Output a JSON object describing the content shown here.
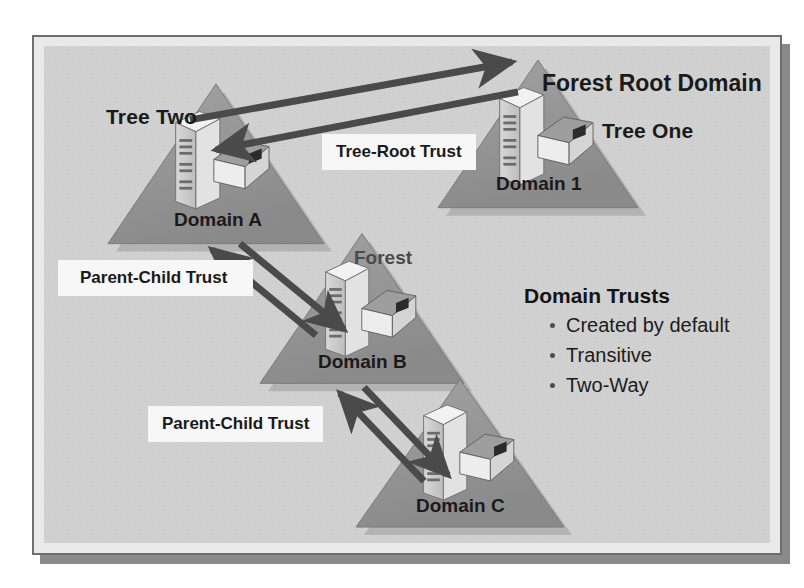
{
  "diagram": {
    "background_color": "#cbcbcb",
    "frame_color": "#e9e9e9",
    "triangle_fill": "#8f8f8f",
    "arrow_color": "#4a4a4a"
  },
  "labels": {
    "forest_root_domain": "Forest Root Domain",
    "tree_one": "Tree One",
    "tree_two": "Tree Two",
    "forest": "Forest"
  },
  "domains": [
    {
      "id": "domain-1",
      "label": "Domain 1",
      "tree": "Tree One"
    },
    {
      "id": "domain-a",
      "label": "Domain A",
      "tree": "Tree Two"
    },
    {
      "id": "domain-b",
      "label": "Domain B",
      "tree": "Tree Two"
    },
    {
      "id": "domain-c",
      "label": "Domain C",
      "tree": "Tree Two"
    }
  ],
  "trust_links": [
    {
      "id": "tree-root-trust",
      "label": "Tree-Root Trust",
      "from": "Domain A",
      "to": "Domain 1",
      "direction": "two-way"
    },
    {
      "id": "parent-child-trust-ab",
      "label": "Parent-Child Trust",
      "from": "Domain A",
      "to": "Domain B",
      "direction": "two-way"
    },
    {
      "id": "parent-child-trust-bc",
      "label": "Parent-Child Trust",
      "from": "Domain B",
      "to": "Domain C",
      "direction": "two-way"
    }
  ],
  "trusts_block": {
    "title": "Domain Trusts",
    "bullets": [
      "Created by default",
      "Transitive",
      "Two-Way"
    ]
  },
  "icons": {
    "server": "server-tower-icon",
    "directory": "open-book-icon",
    "triangle": "domain-triangle-icon",
    "arrow": "trust-arrow-icon",
    "bullet": "bullet-dot-icon"
  }
}
